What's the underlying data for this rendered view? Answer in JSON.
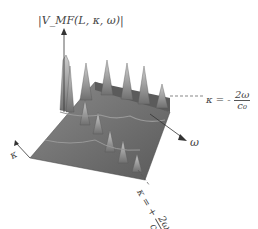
{
  "figure": {
    "type": "3d-surface-plot",
    "z_axis_label": "|V_MF(L, κ, ω)|",
    "x_axis_label": "ω",
    "y_axis_label": "κ",
    "annotations": [
      {
        "id": "upper-line",
        "text_prefix": "κ = -",
        "numerator": "2ω",
        "denominator": "c₀"
      },
      {
        "id": "lower-line",
        "text_prefix": "κ = +",
        "numerator": "2ω",
        "denominator": "c₀"
      }
    ],
    "colors": {
      "surface": "#7a7a7a",
      "surface_dark": "#4a4a4a",
      "surface_light": "#b5b5b5",
      "axis": "#333333",
      "background": "#ffffff"
    }
  }
}
